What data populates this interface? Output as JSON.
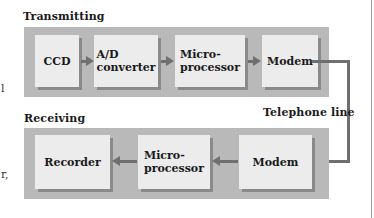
{
  "diagram": {
    "transmitting": {
      "label": "Transmitting",
      "blocks": [
        {
          "label": "CCD"
        },
        {
          "label": "A/D\nconverter"
        },
        {
          "label": "Micro-\nprocessor"
        },
        {
          "label": "Modem"
        }
      ]
    },
    "link": {
      "label": "Telephone line"
    },
    "receiving": {
      "label": "Receiving",
      "blocks": [
        {
          "label": "Recorder"
        },
        {
          "label": "Micro-\nprocessor"
        },
        {
          "label": "Modem"
        }
      ]
    },
    "edge_fragments": [
      "l",
      "r,"
    ],
    "colors": {
      "panel": "#b9b9b9",
      "block": "#ececec",
      "connector": "#6f6f6f"
    }
  }
}
